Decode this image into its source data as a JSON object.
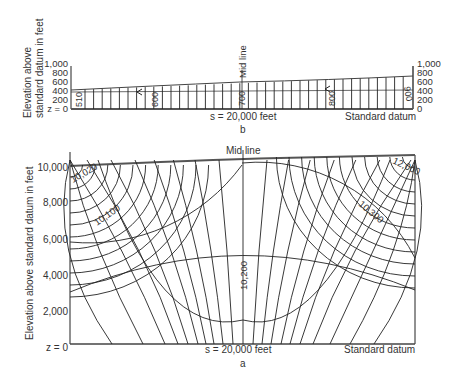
{
  "figure_b": {
    "panel_label": "b",
    "ylabel_line1": "Elevation above",
    "ylabel_line2": "standard datum in feet",
    "left_ticks": [
      "1,000",
      "800",
      "600",
      "400",
      "200",
      "0"
    ],
    "right_ticks": [
      "1,000",
      "800",
      "600",
      "400",
      "200",
      "0"
    ],
    "z_label": "z = 0",
    "mid_line": "Mid line",
    "s_label": "s   =   20,000 feet",
    "datum_label": "Standard datum",
    "contours": [
      "510",
      "600",
      "700",
      "800",
      "900"
    ]
  },
  "figure_a": {
    "panel_label": "a",
    "ylabel": "Elevation above standard datum in feet",
    "ticks": [
      "10,000",
      "8,000",
      "6,000",
      "4,000",
      "2,000"
    ],
    "z_label": "z = 0",
    "mid_line": "Mid line",
    "s_label": "s = 20,000 feet",
    "datum_label": "Standard datum",
    "contours": [
      "10,020",
      "10,100",
      "10,200",
      "10,300",
      "12,000"
    ]
  }
}
